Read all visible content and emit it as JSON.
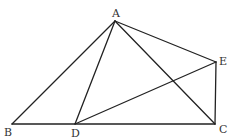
{
  "figure": {
    "points": {
      "A": {
        "label": "A",
        "x": 115,
        "y": 21
      },
      "B": {
        "label": "B",
        "x": 12,
        "y": 124
      },
      "C": {
        "label": "C",
        "x": 215,
        "y": 124
      },
      "D": {
        "label": "D",
        "x": 75,
        "y": 124
      },
      "E": {
        "label": "E",
        "x": 216,
        "y": 62
      }
    },
    "segments": [
      "AB",
      "AD",
      "AC",
      "AE",
      "BC",
      "DE",
      "EC"
    ],
    "line_color": "#222222"
  }
}
